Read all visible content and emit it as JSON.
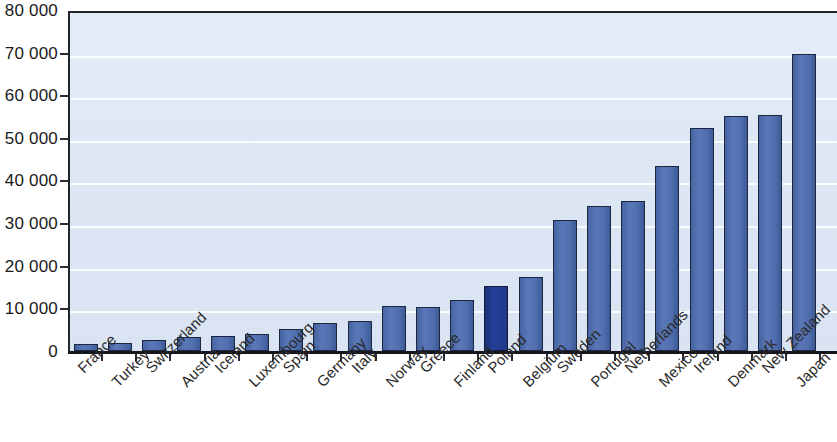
{
  "chart_data": {
    "type": "bar",
    "title": "",
    "subtitle": "",
    "xlabel": "",
    "ylabel": "",
    "ylim": [
      0,
      80000
    ],
    "ytick_labels": [
      "0",
      "10 000",
      "20 000",
      "30 000",
      "40 000",
      "50 000",
      "60 000",
      "70 000",
      "80 000"
    ],
    "ytick_values": [
      0,
      10000,
      20000,
      30000,
      40000,
      50000,
      60000,
      70000,
      80000
    ],
    "grid": true,
    "legend": false,
    "highlight_category": "Poland",
    "categories": [
      "France",
      "Turkey",
      "Switzerland",
      "Austria",
      "Iceland",
      "Luxembourg",
      "Spain",
      "Germany",
      "Italy",
      "Norway",
      "Greece",
      "Finland",
      "Poland",
      "Belgium",
      "Sweden",
      "Portugal",
      "Netherlands",
      "Mexico",
      "Ireland",
      "Denmark",
      "New Zealand",
      "Japan"
    ],
    "values": [
      1600,
      1900,
      2500,
      3400,
      3600,
      3900,
      5200,
      6600,
      7000,
      10600,
      10400,
      12000,
      15200,
      17300,
      30800,
      34000,
      35200,
      43500,
      52300,
      55000,
      55400,
      69700
    ]
  },
  "colors": {
    "bar": "#4a6cb3",
    "bar_highlight": "#1f3887",
    "plot_background": "#dde7f4",
    "gridline": "#ffffff",
    "axis": "#24242c",
    "text": "#1a1a1a"
  }
}
